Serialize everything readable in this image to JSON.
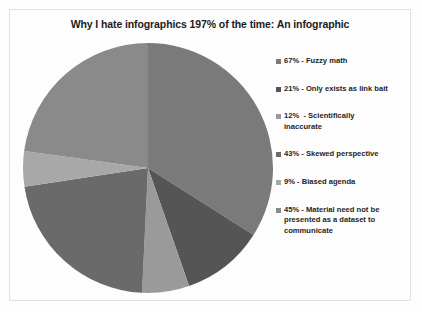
{
  "chart": {
    "title": "Why I hate infographics 197% of the time: An infographic",
    "background_color": "#fdfdfd",
    "frame_color": "#e2e2e2",
    "text_color": "#1f1f1f"
  },
  "chart_data": {
    "type": "pie",
    "title": "Why I hate infographics 197% of the time: An infographic",
    "xlabel": "",
    "ylabel": "",
    "legend_position": "right",
    "grid": false,
    "total_percent": 197,
    "start_angle_deg": 0,
    "direction": "clockwise",
    "categories": [
      "Fuzzy math",
      "Only exists as link bait",
      "Scientifically inaccurate",
      "Skewed perspective",
      "Biased agenda",
      "Material need not be presented as a dataset to communicate"
    ],
    "values": [
      67,
      21,
      12,
      43,
      9,
      45
    ],
    "colors": [
      "#7a7a7a",
      "#555555",
      "#9a9a9a",
      "#6a6a6a",
      "#a8a8a8",
      "#8a8a8a"
    ],
    "legend_entries": [
      {
        "label": "67% - Fuzzy math",
        "value": 67,
        "color": "#7a7a7a",
        "swatch": "legend-swatch-icon"
      },
      {
        "label": "21% - Only exists as link bait",
        "value": 21,
        "color": "#555555",
        "swatch": "legend-swatch-icon"
      },
      {
        "label": "12%  - Scientifically\ninaccurate",
        "value": 12,
        "color": "#9a9a9a",
        "swatch": "legend-swatch-icon"
      },
      {
        "label": "43% - Skewed perspective",
        "value": 43,
        "color": "#6a6a6a",
        "swatch": "legend-swatch-icon"
      },
      {
        "label": "9% - Biased agenda",
        "value": 9,
        "color": "#a8a8a8",
        "swatch": "legend-swatch-icon"
      },
      {
        "label": "45% - Material need not be\npresented as a dataset to\ncommunicate",
        "value": 45,
        "color": "#8a8a8a",
        "swatch": "legend-swatch-icon"
      }
    ]
  }
}
